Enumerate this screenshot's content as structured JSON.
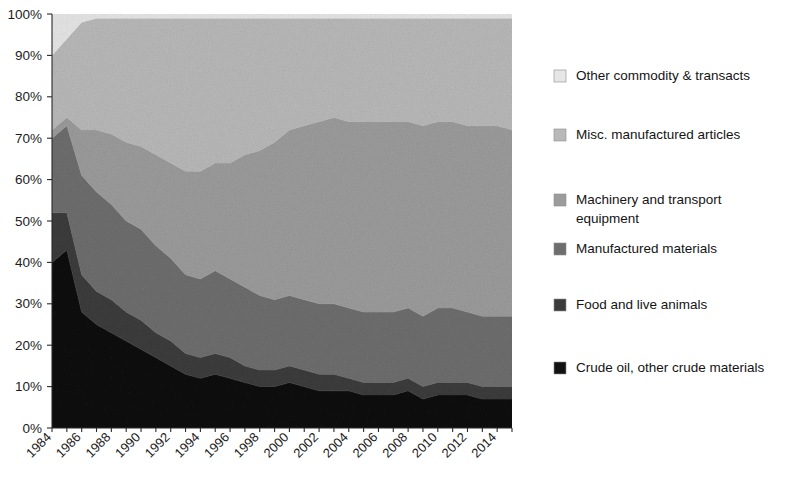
{
  "chart_data": {
    "type": "area",
    "stacked": true,
    "normalized_percent": true,
    "title": "",
    "subtitle": "",
    "xlabel": "",
    "ylabel": "",
    "grid": false,
    "legend_position": "right",
    "ylim": [
      0,
      100
    ],
    "ytick_labels": [
      "0%",
      "10%",
      "20%",
      "30%",
      "40%",
      "50%",
      "60%",
      "70%",
      "80%",
      "90%",
      "100%"
    ],
    "ytick_values": [
      0,
      10,
      20,
      30,
      40,
      50,
      60,
      70,
      80,
      90,
      100
    ],
    "xtick_labels": [
      "1984",
      "1986",
      "1988",
      "1990",
      "1992",
      "1994",
      "1996",
      "1998",
      "2000",
      "2002",
      "2004",
      "2006",
      "2008",
      "2010",
      "2012",
      "2014"
    ],
    "xtick_values": [
      1984,
      1986,
      1988,
      1990,
      1992,
      1994,
      1996,
      1998,
      2000,
      2002,
      2004,
      2006,
      2008,
      2010,
      2012,
      2014
    ],
    "xlim": [
      1984,
      2015
    ],
    "x": [
      1984,
      1985,
      1986,
      1987,
      1988,
      1989,
      1990,
      1991,
      1992,
      1993,
      1994,
      1995,
      1996,
      1997,
      1998,
      1999,
      2000,
      2001,
      2002,
      2003,
      2004,
      2005,
      2006,
      2007,
      2008,
      2009,
      2010,
      2011,
      2012,
      2013,
      2014,
      2015
    ],
    "series": [
      {
        "name": "Crude oil, other crude materials",
        "color": "#121212",
        "stack_order": 1,
        "values": [
          40,
          43,
          28,
          25,
          23,
          21,
          19,
          17,
          15,
          13,
          12,
          13,
          12,
          11,
          10,
          10,
          11,
          10,
          9,
          9,
          9,
          8,
          8,
          8,
          9,
          7,
          8,
          8,
          8,
          7,
          7,
          7
        ]
      },
      {
        "name": "Food and live animals",
        "color": "#3c3c3c",
        "stack_order": 2,
        "values": [
          12,
          9,
          9,
          8,
          8,
          7,
          7,
          6,
          6,
          5,
          5,
          5,
          5,
          4,
          4,
          4,
          4,
          4,
          4,
          4,
          3,
          3,
          3,
          3,
          3,
          3,
          3,
          3,
          3,
          3,
          3,
          3
        ]
      },
      {
        "name": "Manufactured materials",
        "color": "#6e6e6e",
        "stack_order": 3,
        "values": [
          18,
          21,
          24,
          24,
          23,
          22,
          22,
          21,
          20,
          19,
          19,
          20,
          19,
          19,
          18,
          17,
          17,
          17,
          17,
          17,
          17,
          17,
          17,
          17,
          17,
          17,
          18,
          18,
          17,
          17,
          17,
          17
        ]
      },
      {
        "name": "Machinery and transport equipment",
        "color": "#9c9c9c",
        "stack_order": 4,
        "values": [
          2,
          2,
          11,
          15,
          17,
          19,
          20,
          22,
          23,
          25,
          26,
          26,
          28,
          32,
          35,
          38,
          40,
          42,
          44,
          45,
          45,
          46,
          46,
          46,
          45,
          46,
          45,
          45,
          45,
          46,
          46,
          45
        ]
      },
      {
        "name": "Misc. manufactured articles",
        "color": "#b9b9b9",
        "stack_order": 5,
        "values": [
          18,
          19,
          26,
          27,
          28,
          30,
          31,
          33,
          35,
          37,
          37,
          35,
          35,
          33,
          32,
          30,
          27,
          26,
          25,
          24,
          25,
          25,
          25,
          25,
          25,
          26,
          25,
          25,
          26,
          26,
          26,
          27
        ]
      },
      {
        "name": "Other commodity & transacts",
        "color": "#e6e6e6",
        "stack_order": 6,
        "values": [
          10,
          6,
          2,
          1,
          1,
          1,
          1,
          1,
          1,
          1,
          1,
          1,
          1,
          1,
          1,
          1,
          1,
          1,
          1,
          1,
          1,
          1,
          1,
          1,
          1,
          1,
          1,
          1,
          1,
          1,
          1,
          1
        ]
      }
    ],
    "legend_entries": [
      {
        "label": "Other commodity & transacts",
        "color": "#e6e6e6"
      },
      {
        "label": "Misc. manufactured articles",
        "color": "#b9b9b9"
      },
      {
        "label": "Machinery and transport equipment",
        "color": "#9c9c9c"
      },
      {
        "label": "Manufactured materials",
        "color": "#6e6e6e"
      },
      {
        "label": "Food and live animals",
        "color": "#3c3c3c"
      },
      {
        "label": "Crude oil, other crude materials",
        "color": "#121212"
      }
    ],
    "legend_lines": [
      [
        "Other commodity & transacts"
      ],
      [
        "Misc. manufactured articles"
      ],
      [
        "Machinery and transport",
        "equipment"
      ],
      [
        "Manufactured materials"
      ],
      [
        "Food and live animals"
      ],
      [
        "Crude oil, other crude materials"
      ]
    ]
  }
}
